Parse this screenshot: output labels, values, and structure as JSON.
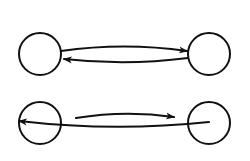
{
  "diagram": {
    "title": "",
    "colors": {
      "stroke": "#111111",
      "background": "#ffffff"
    },
    "rows": [
      {
        "name": "top-pair",
        "nodes": [
          {
            "id": "A",
            "label": "",
            "cx": 40,
            "cy": 54,
            "r": 21
          },
          {
            "id": "B",
            "label": "",
            "cx": 209,
            "cy": 54,
            "r": 21
          }
        ],
        "edges": [
          {
            "from": "A",
            "to": "B",
            "direction": "right",
            "path": "M61,51 Q124,42 187,51"
          },
          {
            "from": "B",
            "to": "A",
            "direction": "left",
            "path": "M188,58 Q126,66 64,59"
          }
        ]
      },
      {
        "name": "bottom-pair",
        "nodes": [
          {
            "id": "C",
            "label": "",
            "cx": 40,
            "cy": 123,
            "r": 21
          },
          {
            "id": "D",
            "label": "",
            "cx": 209,
            "cy": 123,
            "r": 21
          }
        ],
        "edges": [
          {
            "from": "C",
            "to": "D",
            "direction": "right",
            "path": "M76,118 Q125,110 174,117"
          },
          {
            "from": "D",
            "to": "C",
            "direction": "left",
            "path": "M209,122 Q114,132 19,121"
          }
        ]
      }
    ]
  }
}
